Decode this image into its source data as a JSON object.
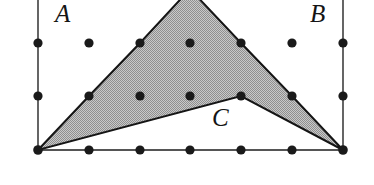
{
  "figure": {
    "canvas": {
      "width": 374,
      "height": 185,
      "background": "#ffffff"
    },
    "colors": {
      "ink": "#151515",
      "dot": "#1a1a1a",
      "grid_line": "#555555",
      "shade_fill": "#b3b3b3",
      "shade_stroke": "#151515",
      "dither_light": "#d6d6d6",
      "dither_dark": "#8f8f8f"
    },
    "labels": [
      {
        "id": "A",
        "text": "A",
        "x": 55,
        "y": 1,
        "style": "italic-serif"
      },
      {
        "id": "B",
        "text": "B",
        "x": 310,
        "y": 1,
        "style": "italic-serif"
      },
      {
        "id": "C",
        "text": "C",
        "x": 212,
        "y": 105,
        "style": "italic-serif"
      }
    ],
    "grid": {
      "columns": 7,
      "rows": 3,
      "x_spacing": 50.8,
      "y_spacing": 53.5,
      "x_values": [
        38,
        89,
        140,
        190,
        241,
        292,
        343
      ],
      "y_values": [
        43,
        96,
        150
      ],
      "dot_radius": 4.6,
      "note": "Top apex of the polygon is cropped by the top edge of the image"
    },
    "dots": [
      {
        "x": 38,
        "y": 43
      },
      {
        "x": 89,
        "y": 43
      },
      {
        "x": 140,
        "y": 43
      },
      {
        "x": 190,
        "y": 43
      },
      {
        "x": 241,
        "y": 43
      },
      {
        "x": 292,
        "y": 43
      },
      {
        "x": 343,
        "y": 43
      },
      {
        "x": 38,
        "y": 96
      },
      {
        "x": 89,
        "y": 96
      },
      {
        "x": 140,
        "y": 96
      },
      {
        "x": 190,
        "y": 96
      },
      {
        "x": 241,
        "y": 96
      },
      {
        "x": 292,
        "y": 96
      },
      {
        "x": 343,
        "y": 96
      },
      {
        "x": 38,
        "y": 150
      },
      {
        "x": 89,
        "y": 150
      },
      {
        "x": 140,
        "y": 150
      },
      {
        "x": 190,
        "y": 150
      },
      {
        "x": 241,
        "y": 150
      },
      {
        "x": 292,
        "y": 150
      },
      {
        "x": 343,
        "y": 150
      }
    ],
    "grid_lines": [
      {
        "id": "left-border",
        "x1": 38,
        "y1": 0,
        "x2": 38,
        "y2": 150
      },
      {
        "id": "right-border",
        "x1": 343,
        "y1": 0,
        "x2": 343,
        "y2": 150
      },
      {
        "id": "bottom-border",
        "x1": 38,
        "y1": 150,
        "x2": 343,
        "y2": 150
      }
    ],
    "polygon": {
      "id": "shaded-arrowhead",
      "fill": "#b3b3b3",
      "stroke": "#151515",
      "stroke_width": 2,
      "points": "38,150 89,96 140,43 190,-11 241,43 292,96 343,150 241,96",
      "vertices": [
        {
          "x": 38,
          "y": 150,
          "desc": "bottom-left-corner"
        },
        {
          "x": 89,
          "y": 96,
          "desc": "left-upper-edge"
        },
        {
          "x": 140,
          "y": 43,
          "desc": "left-upper-edge"
        },
        {
          "x": 190,
          "y": -11,
          "desc": "apex-cropped-above-image"
        },
        {
          "x": 241,
          "y": 43,
          "desc": "right-upper-edge"
        },
        {
          "x": 292,
          "y": 96,
          "desc": "right-upper-edge"
        },
        {
          "x": 343,
          "y": 150,
          "desc": "bottom-right-corner"
        },
        {
          "x": 241,
          "y": 96,
          "desc": "reflex-notch-vertex-C"
        }
      ]
    }
  }
}
